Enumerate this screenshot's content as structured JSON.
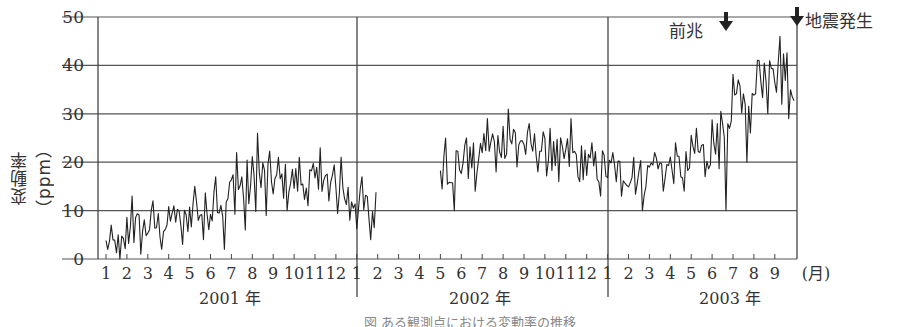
{
  "chart_data": {
    "type": "line",
    "title": "",
    "ylabel": "変動率（ppm）",
    "xlabel": "(月)",
    "ylim": [
      0,
      50
    ],
    "yticks": [
      0,
      10,
      20,
      30,
      40,
      50
    ],
    "grid": {
      "horizontal": true,
      "vertical_year_dividers": true
    },
    "x_month_labels": [
      "1",
      "2",
      "3",
      "4",
      "5",
      "6",
      "7",
      "8",
      "9",
      "10",
      "11",
      "12",
      "1",
      "2",
      "3",
      "4",
      "5",
      "6",
      "7",
      "8",
      "9",
      "10",
      "11",
      "12",
      "1",
      "2",
      "3",
      "4",
      "5",
      "6",
      "7",
      "8",
      "9"
    ],
    "x_unit_label": "(月)",
    "year_labels": [
      "2001 年",
      "2002 年",
      "2003 年"
    ],
    "annotations": [
      {
        "text": "前兆",
        "arrow": "down",
        "approx_x": "2003-06 end",
        "meaning": "precursor"
      },
      {
        "text": "地震発生",
        "arrow": "down",
        "approx_x": "2003-09 end",
        "meaning": "earthquake occurred"
      }
    ],
    "series": [
      {
        "name": "変動率",
        "segments": [
          {
            "start": "2001-01",
            "end": "2002-01",
            "monthly_approx": [
              {
                "month": "2001-01",
                "min": 0,
                "max": 7,
                "mean": 3
              },
              {
                "month": "2001-02",
                "min": 1,
                "max": 13,
                "mean": 6
              },
              {
                "month": "2001-03",
                "min": 2,
                "max": 12,
                "mean": 7
              },
              {
                "month": "2001-04",
                "min": 3,
                "max": 11,
                "mean": 8
              },
              {
                "month": "2001-05",
                "min": 4,
                "max": 15,
                "mean": 10
              },
              {
                "month": "2001-06",
                "min": 2,
                "max": 17,
                "mean": 12
              },
              {
                "month": "2001-07",
                "min": 6,
                "max": 22,
                "mean": 15
              },
              {
                "month": "2001-08",
                "min": 9,
                "max": 26,
                "mean": 16
              },
              {
                "month": "2001-09",
                "min": 10,
                "max": 21,
                "mean": 16
              },
              {
                "month": "2001-10",
                "min": 11,
                "max": 21,
                "mean": 16
              },
              {
                "month": "2001-11",
                "min": 12,
                "max": 23,
                "mean": 16
              },
              {
                "month": "2001-12",
                "min": 8,
                "max": 21,
                "mean": 13
              },
              {
                "month": "2002-01",
                "min": 4,
                "max": 17,
                "mean": 10
              }
            ]
          },
          {
            "start": "2002-05",
            "end": "2003-09",
            "monthly_approx": [
              {
                "month": "2002-05",
                "min": 10,
                "max": 25,
                "mean": 20
              },
              {
                "month": "2002-06",
                "min": 14,
                "max": 25,
                "mean": 20
              },
              {
                "month": "2002-07",
                "min": 18,
                "max": 29,
                "mean": 24
              },
              {
                "month": "2002-08",
                "min": 19,
                "max": 31,
                "mean": 25
              },
              {
                "month": "2002-09",
                "min": 18,
                "max": 28,
                "mean": 23
              },
              {
                "month": "2002-10",
                "min": 16,
                "max": 27,
                "mean": 21
              },
              {
                "month": "2002-11",
                "min": 16,
                "max": 29,
                "mean": 21
              },
              {
                "month": "2002-12",
                "min": 13,
                "max": 24,
                "mean": 19
              },
              {
                "month": "2003-01",
                "min": 13,
                "max": 22,
                "mean": 18
              },
              {
                "month": "2003-02",
                "min": 10,
                "max": 21,
                "mean": 17
              },
              {
                "month": "2003-03",
                "min": 14,
                "max": 22,
                "mean": 19
              },
              {
                "month": "2003-04",
                "min": 14,
                "max": 24,
                "mean": 19
              },
              {
                "month": "2003-05",
                "min": 17,
                "max": 27,
                "mean": 22
              },
              {
                "month": "2003-06",
                "min": 10,
                "max": 28,
                "mean": 24
              },
              {
                "month": "2003-07",
                "min": 20,
                "max": 37,
                "mean": 32
              },
              {
                "month": "2003-08",
                "min": 30,
                "max": 41,
                "mean": 37
              },
              {
                "month": "2003-09",
                "min": 29,
                "max": 46,
                "mean": 38
              }
            ]
          }
        ]
      }
    ]
  },
  "annotations": {
    "precursor_label": "前兆",
    "earthquake_label": "地震発生"
  },
  "caption": "図 ある観測点における変動率の推移"
}
